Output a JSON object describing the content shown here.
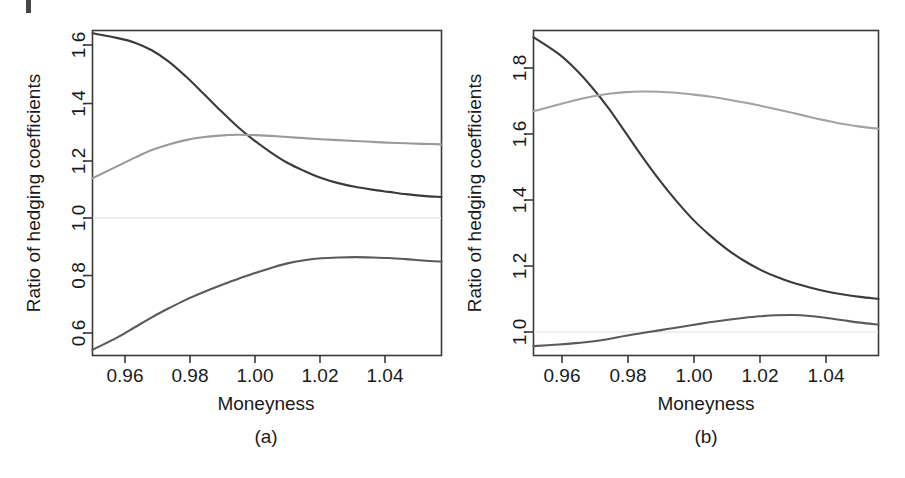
{
  "figure": {
    "background_color": "#ffffff",
    "scan_artifact": true
  },
  "panels": [
    {
      "id": "a",
      "caption": "(a)",
      "axis_title_x": "Moneyness",
      "axis_title_y": "Ratio of hedging coefficients",
      "x_ticks": [
        "0.96",
        "0.98",
        "1.00",
        "1.02",
        "1.04"
      ],
      "y_ticks": [
        "0.6",
        "0.8",
        "1.0",
        "1.2",
        "1.4",
        "1.6"
      ]
    },
    {
      "id": "b",
      "caption": "(b)",
      "axis_title_x": "Moneyness",
      "axis_title_y": "Ratio of hedging coefficients",
      "x_ticks": [
        "0.96",
        "0.98",
        "1.00",
        "1.02",
        "1.04"
      ],
      "y_ticks": [
        "1.0",
        "1.2",
        "1.4",
        "1.6",
        "1.8"
      ]
    }
  ],
  "chart_data": [
    {
      "type": "line",
      "panel": "a",
      "title": "(a)",
      "xlabel": "Moneyness",
      "ylabel": "Ratio of hedging coefficients",
      "xlim": [
        0.9525,
        1.0555
      ],
      "ylim": [
        0.525,
        1.675
      ],
      "xticks": [
        0.96,
        0.98,
        1.0,
        1.02,
        1.04
      ],
      "yticks": [
        0.6,
        0.8,
        1.0,
        1.2,
        1.4,
        1.6
      ],
      "grid": false,
      "legend": "none",
      "reference_line": {
        "value": 1.0,
        "orientation": "horizontal",
        "color": "#e8e8e8"
      },
      "x": [
        0.9525,
        0.96,
        0.965,
        0.97,
        0.975,
        0.98,
        0.985,
        0.99,
        0.995,
        1.0,
        1.005,
        1.01,
        1.015,
        1.02,
        1.025,
        1.03,
        1.035,
        1.04,
        1.045,
        1.05,
        1.0555
      ],
      "series": [
        {
          "name": "upper-decreasing",
          "color": "#3b3b3b",
          "values": [
            1.665,
            1.648,
            1.632,
            1.605,
            1.565,
            1.513,
            1.455,
            1.395,
            1.338,
            1.288,
            1.245,
            1.207,
            1.178,
            1.153,
            1.135,
            1.122,
            1.112,
            1.104,
            1.096,
            1.09,
            1.086
          ]
        },
        {
          "name": "middle-flattening",
          "color": "#9a9a9a",
          "values": [
            1.152,
            1.196,
            1.225,
            1.252,
            1.272,
            1.287,
            1.297,
            1.303,
            1.306,
            1.305,
            1.302,
            1.298,
            1.294,
            1.29,
            1.287,
            1.284,
            1.281,
            1.278,
            1.276,
            1.274,
            1.272
          ]
        },
        {
          "name": "lower-increasing",
          "color": "#5a5a5a",
          "values": [
            0.545,
            0.59,
            0.625,
            0.66,
            0.692,
            0.722,
            0.748,
            0.772,
            0.794,
            0.815,
            0.834,
            0.851,
            0.862,
            0.869,
            0.872,
            0.873,
            0.872,
            0.87,
            0.866,
            0.861,
            0.857
          ]
        }
      ]
    },
    {
      "type": "line",
      "panel": "b",
      "title": "(b)",
      "xlabel": "Moneyness",
      "ylabel": "Ratio of hedging coefficients",
      "xlim": [
        0.9525,
        1.0555
      ],
      "ylim": [
        0.935,
        1.905
      ],
      "xticks": [
        0.96,
        0.98,
        1.0,
        1.02,
        1.04
      ],
      "yticks": [
        1.0,
        1.2,
        1.4,
        1.6,
        1.8
      ],
      "grid": false,
      "legend": "none",
      "reference_line": {
        "value": 1.0,
        "orientation": "horizontal",
        "color": "#ececec"
      },
      "x": [
        0.9525,
        0.96,
        0.965,
        0.97,
        0.975,
        0.98,
        0.985,
        0.99,
        0.995,
        1.0,
        1.005,
        1.01,
        1.015,
        1.02,
        1.025,
        1.03,
        1.035,
        1.04,
        1.045,
        1.05,
        1.0555
      ],
      "series": [
        {
          "name": "upper-decreasing",
          "color": "#3b3b3b",
          "values": [
            1.885,
            1.835,
            1.79,
            1.735,
            1.672,
            1.6,
            1.528,
            1.46,
            1.398,
            1.342,
            1.295,
            1.254,
            1.22,
            1.192,
            1.17,
            1.152,
            1.138,
            1.126,
            1.117,
            1.11,
            1.104
          ]
        },
        {
          "name": "middle-hump",
          "color": "#a3a3a3",
          "values": [
            1.664,
            1.684,
            1.697,
            1.708,
            1.716,
            1.721,
            1.723,
            1.722,
            1.719,
            1.714,
            1.708,
            1.7,
            1.691,
            1.681,
            1.67,
            1.659,
            1.647,
            1.636,
            1.626,
            1.618,
            1.612
          ]
        },
        {
          "name": "lower-increasing",
          "color": "#5a5a5a",
          "values": [
            0.963,
            0.968,
            0.972,
            0.977,
            0.984,
            0.994,
            1.002,
            1.01,
            1.018,
            1.026,
            1.034,
            1.041,
            1.047,
            1.052,
            1.055,
            1.056,
            1.053,
            1.047,
            1.04,
            1.033,
            1.027
          ]
        }
      ]
    }
  ]
}
